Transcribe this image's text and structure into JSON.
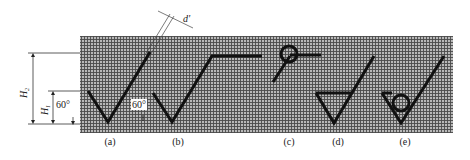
{
  "figure": {
    "background": "#ffffff",
    "grid": {
      "fill": "#9a9a9a",
      "line_color": "#444444",
      "x": 80,
      "y": 36,
      "width": 373,
      "height": 97
    },
    "stroke_color": "#111111",
    "dimension_labels": {
      "h2": "H",
      "h2_sub": "2",
      "h1": "H",
      "h1_sub": "1",
      "d_prime": "d'",
      "angle_left": "60°",
      "angle_a": "60°"
    },
    "symbols": [
      {
        "id": "a",
        "caption": "(a)",
        "description": "basic symbol, V with long arm"
      },
      {
        "id": "b",
        "caption": "(b)",
        "description": "V with horizontal extension"
      },
      {
        "id": "c",
        "caption": "(c)",
        "description": "circle with leader line"
      },
      {
        "id": "d",
        "caption": "(d)",
        "description": "V with triangle (material removal)"
      },
      {
        "id": "e",
        "caption": "(e)",
        "description": "V with circle (no material removal)"
      }
    ]
  }
}
